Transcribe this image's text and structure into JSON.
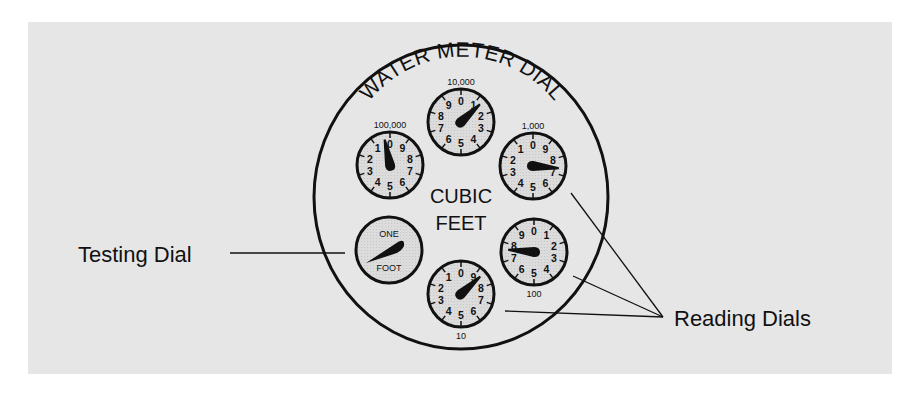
{
  "diagram": {
    "title": "WATER METER DIAL",
    "center_label": [
      "CUBIC",
      "FEET"
    ],
    "callouts": {
      "testing": "Testing Dial",
      "reading": "Reading Dials"
    },
    "colors": {
      "background": "#e6e6e6",
      "dial_face": "#d9d9d9",
      "ink": "#111111"
    },
    "dials": [
      {
        "id": "100000",
        "scale_label": "100,000",
        "direction": "counterclockwise",
        "reading": 1,
        "cx": 390,
        "cy": 165,
        "needle_angle": -12
      },
      {
        "id": "10000",
        "scale_label": "10,000",
        "direction": "clockwise",
        "reading": 1,
        "cx": 461,
        "cy": 122,
        "needle_angle": 47
      },
      {
        "id": "1000",
        "scale_label": "1,000",
        "direction": "counterclockwise",
        "reading": 7,
        "cx": 533,
        "cy": 166,
        "needle_angle": 95
      },
      {
        "id": "100",
        "scale_label": "100",
        "direction": "clockwise",
        "reading": 8,
        "cx": 534,
        "cy": 252,
        "needle_angle": -85
      },
      {
        "id": "10",
        "scale_label": "10",
        "direction": "counterclockwise",
        "reading": 8,
        "cx": 461,
        "cy": 294,
        "needle_angle": 48
      }
    ],
    "testing_dial": {
      "top_label": "ONE",
      "bottom_label": "FOOT",
      "cx": 389,
      "cy": 250
    },
    "digits": [
      "0",
      "1",
      "2",
      "3",
      "4",
      "5",
      "6",
      "7",
      "8",
      "9"
    ]
  }
}
